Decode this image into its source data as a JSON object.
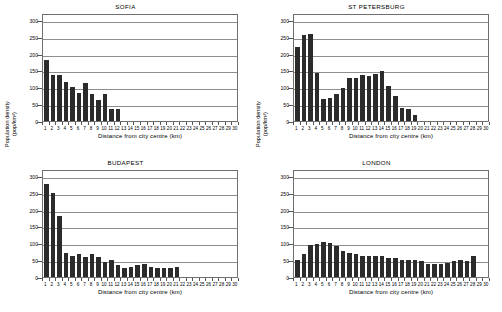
{
  "figure": {
    "panel_count": 4,
    "y_axis_title_line1": "Population density",
    "y_axis_title_line2": "(pop/km²)",
    "x_axis_title": "Distance from city centre (km)",
    "y_ticks": [
      "0",
      "50",
      "100",
      "150",
      "200",
      "250",
      "300"
    ],
    "x_ticks": [
      "1",
      "2",
      "3",
      "4",
      "5",
      "6",
      "7",
      "8",
      "9",
      "10",
      "11",
      "12",
      "13",
      "14",
      "15",
      "16",
      "17",
      "18",
      "19",
      "20",
      "21",
      "22",
      "23",
      "24",
      "25",
      "26",
      "27",
      "28",
      "29",
      "30"
    ],
    "bar_color": "#2b2b2b",
    "grid_color": "#8e8e8e",
    "axis_color": "#6f6f6f",
    "background": "#ffffff"
  },
  "chart_data": [
    {
      "type": "bar",
      "title": "SOFIA",
      "xlabel": "Distance from city centre (km)",
      "ylabel": "Population density (pop/km²)",
      "ylim": [
        0,
        320
      ],
      "yticks": [
        0,
        50,
        100,
        150,
        200,
        250,
        300
      ],
      "xlim": [
        0,
        30
      ],
      "grid": true,
      "legend": "none",
      "categories": [
        1,
        2,
        3,
        4,
        5,
        6,
        7,
        8,
        9,
        10,
        11,
        12
      ],
      "values": [
        181,
        135,
        137,
        117,
        100,
        83,
        112,
        79,
        63,
        80,
        36,
        36
      ]
    },
    {
      "type": "bar",
      "title": "ST PETERSBURG",
      "xlabel": "Distance from city centre (km)",
      "ylabel": "Population density (pop/km²)",
      "ylim": [
        0,
        320
      ],
      "yticks": [
        0,
        50,
        100,
        150,
        200,
        250,
        300
      ],
      "xlim": [
        0,
        30
      ],
      "grid": true,
      "legend": "none",
      "categories": [
        1,
        2,
        3,
        4,
        5,
        6,
        7,
        8,
        9,
        10,
        11,
        12,
        13,
        14,
        15,
        16,
        17,
        18,
        19
      ],
      "values": [
        220,
        256,
        259,
        141,
        66,
        69,
        79,
        99,
        128,
        128,
        136,
        134,
        138,
        147,
        104,
        73,
        39,
        37,
        18
      ]
    },
    {
      "type": "bar",
      "title": "BUDAPEST",
      "xlabel": "Distance from city centre (km)",
      "ylabel": "Population density (pop/km²)",
      "ylim": [
        0,
        320
      ],
      "yticks": [
        0,
        50,
        100,
        150,
        200,
        250,
        300
      ],
      "xlim": [
        0,
        30
      ],
      "grid": true,
      "legend": "none",
      "categories": [
        1,
        2,
        3,
        4,
        5,
        6,
        7,
        8,
        9,
        10,
        11,
        12,
        13,
        14,
        15,
        16,
        17,
        18,
        19,
        20,
        21
      ],
      "values": [
        277,
        250,
        182,
        71,
        62,
        67,
        60,
        69,
        59,
        44,
        49,
        35,
        27,
        31,
        35,
        39,
        31,
        28,
        28,
        28,
        31
      ]
    },
    {
      "type": "bar",
      "title": "LONDON",
      "xlabel": "Distance from city centre (km)",
      "ylabel": "Population density (pop/km²)",
      "ylim": [
        0,
        320
      ],
      "yticks": [
        0,
        50,
        100,
        150,
        200,
        250,
        300
      ],
      "xlim": [
        0,
        30
      ],
      "grid": true,
      "legend": "none",
      "categories": [
        1,
        2,
        3,
        4,
        5,
        6,
        7,
        8,
        9,
        10,
        11,
        12,
        13,
        14,
        15,
        16,
        17,
        18,
        19,
        20,
        21,
        22,
        23,
        24,
        25,
        26,
        27,
        28
      ],
      "values": [
        51,
        68,
        94,
        99,
        105,
        101,
        93,
        78,
        72,
        68,
        61,
        61,
        62,
        61,
        57,
        56,
        51,
        51,
        49,
        47,
        39,
        38,
        39,
        41,
        47,
        51,
        48,
        61
      ]
    }
  ]
}
